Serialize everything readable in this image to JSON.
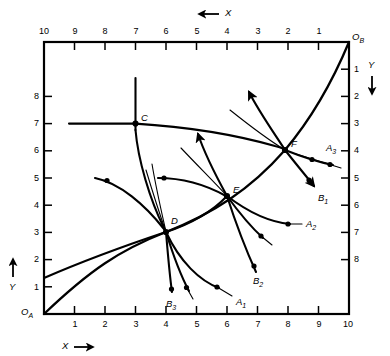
{
  "figure": {
    "type": "technical-diagram",
    "background": "#ffffff",
    "ink": "#000000"
  },
  "axes": {
    "bottom": {
      "name": "x-axis-bottom",
      "label": "X",
      "arrow": "right",
      "ticks": [
        "1",
        "2",
        "3",
        "4",
        "5",
        "6",
        "7",
        "8",
        "9",
        "10"
      ],
      "origin": "O",
      "origin_sub": "A"
    },
    "top": {
      "name": "x-axis-top",
      "label": "X",
      "arrow": "left",
      "ticks": [
        "10",
        "9",
        "8",
        "7",
        "6",
        "5",
        "4",
        "3",
        "2",
        "1"
      ],
      "origin": "O",
      "origin_sub": "B"
    },
    "left": {
      "name": "y-axis-left",
      "label": "Y",
      "arrow": "up",
      "ticks": [
        "1",
        "2",
        "3",
        "4",
        "5",
        "6",
        "7",
        "8"
      ]
    },
    "right": {
      "name": "y-axis-right",
      "label": "Y",
      "arrow": "down",
      "ticks": [
        "1",
        "2",
        "3",
        "4",
        "5",
        "6",
        "7",
        "8"
      ],
      "corner_tick": "10"
    }
  },
  "nodes": [
    {
      "id": "C",
      "label": "C",
      "x": 3.0,
      "y": 7.0
    },
    {
      "id": "D",
      "label": "D",
      "x": 4.0,
      "y": 3.0
    },
    {
      "id": "E",
      "label": "E",
      "x": 6.0,
      "y": 4.0
    },
    {
      "id": "F",
      "label": "F",
      "x": 8.0,
      "y": 6.0
    }
  ],
  "curve_labels": [
    {
      "id": "A1",
      "base": "A",
      "sub": "1",
      "x": 6.35,
      "y": 0.55
    },
    {
      "id": "A2",
      "base": "A",
      "sub": "2",
      "x": 8.25,
      "y": 2.95
    },
    {
      "id": "A3",
      "base": "A",
      "sub": "3",
      "x": 9.45,
      "y": 5.55
    },
    {
      "id": "B1",
      "base": "B",
      "sub": "1",
      "x": 8.95,
      "y": 4.35
    },
    {
      "id": "B2",
      "base": "B",
      "sub": "2",
      "x": 7.15,
      "y": 1.1
    },
    {
      "id": "B3",
      "base": "B",
      "sub": "3",
      "x": 4.6,
      "y": 0.3
    }
  ]
}
